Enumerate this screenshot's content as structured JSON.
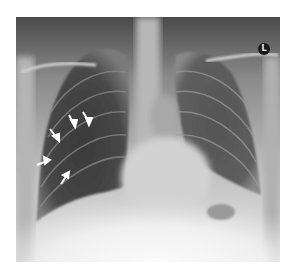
{
  "image": {
    "type": "chest-radiograph",
    "view": "frontal",
    "side_marker": "L",
    "arrow_count": 5,
    "colors": {
      "background": "#ffffff",
      "marker_bg": "#1a1a1a",
      "marker_text": "#eeeeee"
    }
  }
}
